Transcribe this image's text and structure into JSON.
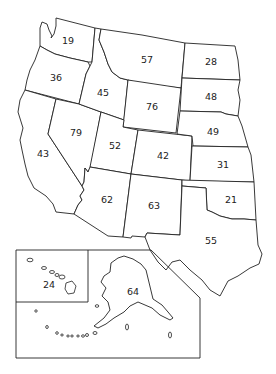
{
  "map": {
    "title": "",
    "states": [
      {
        "id": "WA",
        "value": "19",
        "x": 68,
        "y": 41
      },
      {
        "id": "OR",
        "value": "36",
        "x": 56,
        "y": 78
      },
      {
        "id": "CA",
        "value": "43",
        "x": 43,
        "y": 154
      },
      {
        "id": "ID",
        "value": "45",
        "x": 103,
        "y": 93
      },
      {
        "id": "NV",
        "value": "79",
        "x": 76,
        "y": 133
      },
      {
        "id": "MT",
        "value": "57",
        "x": 147,
        "y": 60
      },
      {
        "id": "WY",
        "value": "76",
        "x": 152,
        "y": 107
      },
      {
        "id": "UT",
        "value": "52",
        "x": 115,
        "y": 146
      },
      {
        "id": "CO",
        "value": "42",
        "x": 163,
        "y": 156
      },
      {
        "id": "AZ",
        "value": "62",
        "x": 107,
        "y": 200
      },
      {
        "id": "NM",
        "value": "63",
        "x": 154,
        "y": 206
      },
      {
        "id": "ND",
        "value": "28",
        "x": 211,
        "y": 62
      },
      {
        "id": "SD",
        "value": "48",
        "x": 211,
        "y": 97
      },
      {
        "id": "NE",
        "value": "49",
        "x": 213,
        "y": 132
      },
      {
        "id": "KS",
        "value": "31",
        "x": 223,
        "y": 165
      },
      {
        "id": "OK",
        "value": "21",
        "x": 231,
        "y": 200
      },
      {
        "id": "TX",
        "value": "55",
        "x": 211,
        "y": 241
      },
      {
        "id": "HI",
        "value": "24",
        "x": 49,
        "y": 285
      },
      {
        "id": "AK",
        "value": "64",
        "x": 133,
        "y": 292
      }
    ]
  }
}
